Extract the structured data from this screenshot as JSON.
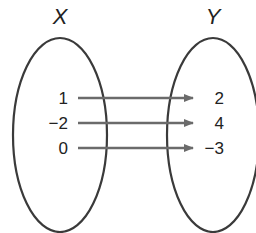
{
  "diagram": {
    "type": "mapping",
    "domain_label": "X",
    "range_label": "Y",
    "domain_values": [
      "1",
      "−2",
      "0"
    ],
    "range_values": [
      "2",
      "4",
      "−3"
    ],
    "mappings": [
      {
        "from": "1",
        "to": "2"
      },
      {
        "from": "−2",
        "to": "4"
      },
      {
        "from": "0",
        "to": "−3"
      }
    ],
    "colors": {
      "ellipse": "#3a3a3a",
      "arrow": "#6b6b6b",
      "text": "#222222"
    }
  }
}
